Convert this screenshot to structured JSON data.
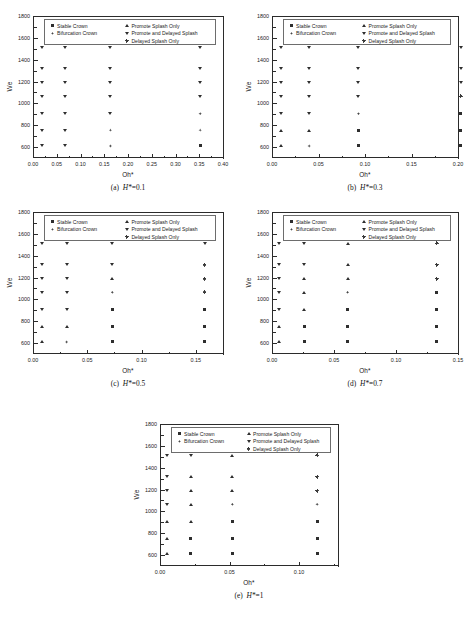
{
  "figure": {
    "axis_titles": {
      "x": "Oh*",
      "y": "We"
    },
    "legend_entries": [
      {
        "marker": "square",
        "label": "Stable Crown"
      },
      {
        "marker": "bifurcation",
        "label": "Bifurcation Crown"
      },
      {
        "marker": "tri-up",
        "label": "Promote Splash Only"
      },
      {
        "marker": "tri-down",
        "label": "Promote and Delayed Splash"
      },
      {
        "marker": "plus",
        "label": "Delayed Splash Only"
      }
    ],
    "y_ticks": [
      "600",
      "800",
      "1000",
      "1200",
      "1400",
      "1600",
      "1800"
    ]
  },
  "chart_data": [
    {
      "id": "a",
      "type": "scatter",
      "title": "(a)  H*=0.1",
      "caption_prefix": "(a)",
      "caption_symbol": "H*",
      "caption_value": "=0.1",
      "xlabel": "Oh*",
      "ylabel": "We",
      "xlim": [
        0.0,
        0.4
      ],
      "ylim": [
        500,
        1800
      ],
      "x_ticks": [
        "0.00",
        "0.05",
        "0.10",
        "0.15",
        "0.20",
        "0.25",
        "0.30",
        "0.35",
        "0.40"
      ],
      "y_ticks": [
        "600",
        "800",
        "1000",
        "1200",
        "1400",
        "1600",
        "1800"
      ],
      "x_values": [
        0.018,
        0.068,
        0.163,
        0.352
      ],
      "y_values": [
        610,
        755,
        905,
        1065,
        1190,
        1315,
        1515
      ],
      "points": [
        {
          "x": 0.018,
          "y": 1515,
          "marker": "tri-down"
        },
        {
          "x": 0.068,
          "y": 1515,
          "marker": "tri-down"
        },
        {
          "x": 0.163,
          "y": 1515,
          "marker": "tri-down"
        },
        {
          "x": 0.352,
          "y": 1515,
          "marker": "tri-down"
        },
        {
          "x": 0.018,
          "y": 1315,
          "marker": "tri-down"
        },
        {
          "x": 0.068,
          "y": 1315,
          "marker": "tri-down"
        },
        {
          "x": 0.163,
          "y": 1315,
          "marker": "tri-down"
        },
        {
          "x": 0.352,
          "y": 1315,
          "marker": "tri-down"
        },
        {
          "x": 0.018,
          "y": 1190,
          "marker": "tri-down"
        },
        {
          "x": 0.068,
          "y": 1190,
          "marker": "tri-down"
        },
        {
          "x": 0.163,
          "y": 1190,
          "marker": "tri-down"
        },
        {
          "x": 0.352,
          "y": 1190,
          "marker": "tri-down"
        },
        {
          "x": 0.018,
          "y": 1065,
          "marker": "tri-down"
        },
        {
          "x": 0.068,
          "y": 1065,
          "marker": "tri-down"
        },
        {
          "x": 0.163,
          "y": 1065,
          "marker": "tri-down"
        },
        {
          "x": 0.352,
          "y": 1065,
          "marker": "tri-down"
        },
        {
          "x": 0.018,
          "y": 905,
          "marker": "tri-down"
        },
        {
          "x": 0.068,
          "y": 905,
          "marker": "tri-down"
        },
        {
          "x": 0.163,
          "y": 905,
          "marker": "tri-down"
        },
        {
          "x": 0.352,
          "y": 905,
          "marker": "bifurcation"
        },
        {
          "x": 0.018,
          "y": 755,
          "marker": "tri-down"
        },
        {
          "x": 0.068,
          "y": 755,
          "marker": "tri-down"
        },
        {
          "x": 0.163,
          "y": 755,
          "marker": "bifurcation"
        },
        {
          "x": 0.352,
          "y": 755,
          "marker": "bifurcation"
        },
        {
          "x": 0.018,
          "y": 610,
          "marker": "tri-down"
        },
        {
          "x": 0.068,
          "y": 610,
          "marker": "tri-down"
        },
        {
          "x": 0.163,
          "y": 610,
          "marker": "bifurcation"
        },
        {
          "x": 0.352,
          "y": 610,
          "marker": "square"
        }
      ]
    },
    {
      "id": "b",
      "type": "scatter",
      "title": "(b)  H*=0.3",
      "caption_prefix": "(b)",
      "caption_symbol": "H*",
      "caption_value": "=0.3",
      "xlabel": "Oh*",
      "ylabel": "We",
      "xlim": [
        0.0,
        0.2
      ],
      "ylim": [
        500,
        1800
      ],
      "x_ticks": [
        "0.00",
        "0.05",
        "0.10",
        "0.15",
        "0.20"
      ],
      "y_ticks": [
        "600",
        "800",
        "1000",
        "1200",
        "1400",
        "1600",
        "1800"
      ],
      "x_values": [
        0.01,
        0.04,
        0.093,
        0.203
      ],
      "y_values": [
        610,
        755,
        905,
        1065,
        1190,
        1315,
        1515
      ],
      "points": [
        {
          "x": 0.01,
          "y": 1515,
          "marker": "tri-down"
        },
        {
          "x": 0.04,
          "y": 1515,
          "marker": "tri-down"
        },
        {
          "x": 0.093,
          "y": 1515,
          "marker": "tri-down"
        },
        {
          "x": 0.203,
          "y": 1515,
          "marker": "tri-down"
        },
        {
          "x": 0.01,
          "y": 1315,
          "marker": "tri-down"
        },
        {
          "x": 0.04,
          "y": 1315,
          "marker": "tri-down"
        },
        {
          "x": 0.093,
          "y": 1315,
          "marker": "tri-down"
        },
        {
          "x": 0.203,
          "y": 1315,
          "marker": "tri-down"
        },
        {
          "x": 0.01,
          "y": 1190,
          "marker": "tri-down"
        },
        {
          "x": 0.04,
          "y": 1190,
          "marker": "tri-down"
        },
        {
          "x": 0.093,
          "y": 1190,
          "marker": "tri-down"
        },
        {
          "x": 0.203,
          "y": 1190,
          "marker": "tri-down"
        },
        {
          "x": 0.01,
          "y": 1065,
          "marker": "tri-down"
        },
        {
          "x": 0.04,
          "y": 1065,
          "marker": "tri-down"
        },
        {
          "x": 0.093,
          "y": 1065,
          "marker": "tri-down"
        },
        {
          "x": 0.203,
          "y": 1065,
          "marker": "plus"
        },
        {
          "x": 0.01,
          "y": 905,
          "marker": "tri-down"
        },
        {
          "x": 0.04,
          "y": 905,
          "marker": "tri-down"
        },
        {
          "x": 0.093,
          "y": 905,
          "marker": "bifurcation"
        },
        {
          "x": 0.203,
          "y": 905,
          "marker": "square"
        },
        {
          "x": 0.01,
          "y": 755,
          "marker": "tri-up"
        },
        {
          "x": 0.04,
          "y": 755,
          "marker": "tri-up"
        },
        {
          "x": 0.093,
          "y": 755,
          "marker": "square"
        },
        {
          "x": 0.203,
          "y": 755,
          "marker": "square"
        },
        {
          "x": 0.01,
          "y": 610,
          "marker": "tri-up"
        },
        {
          "x": 0.04,
          "y": 610,
          "marker": "bifurcation"
        },
        {
          "x": 0.093,
          "y": 610,
          "marker": "square"
        },
        {
          "x": 0.203,
          "y": 610,
          "marker": "square"
        }
      ]
    },
    {
      "id": "c",
      "type": "scatter",
      "title": "(c)  H*=0.5",
      "caption_prefix": "(c)",
      "caption_symbol": "H*",
      "caption_value": "=0.5",
      "xlabel": "Oh*",
      "ylabel": "We",
      "xlim": [
        0.0,
        0.175
      ],
      "ylim": [
        500,
        1800
      ],
      "x_ticks": [
        "0.00",
        "0.05",
        "0.10",
        "0.15"
      ],
      "y_ticks": [
        "600",
        "800",
        "1000",
        "1200",
        "1400",
        "1600",
        "1800"
      ],
      "x_values": [
        0.008,
        0.031,
        0.073,
        0.158
      ],
      "y_values": [
        610,
        755,
        905,
        1065,
        1190,
        1315,
        1515
      ],
      "points": [
        {
          "x": 0.008,
          "y": 1515,
          "marker": "tri-down"
        },
        {
          "x": 0.031,
          "y": 1515,
          "marker": "tri-down"
        },
        {
          "x": 0.073,
          "y": 1515,
          "marker": "tri-down"
        },
        {
          "x": 0.158,
          "y": 1515,
          "marker": "tri-down"
        },
        {
          "x": 0.008,
          "y": 1315,
          "marker": "tri-down"
        },
        {
          "x": 0.031,
          "y": 1315,
          "marker": "tri-down"
        },
        {
          "x": 0.073,
          "y": 1315,
          "marker": "tri-down"
        },
        {
          "x": 0.158,
          "y": 1315,
          "marker": "plus"
        },
        {
          "x": 0.008,
          "y": 1190,
          "marker": "tri-down"
        },
        {
          "x": 0.031,
          "y": 1190,
          "marker": "tri-down"
        },
        {
          "x": 0.073,
          "y": 1190,
          "marker": "tri-up"
        },
        {
          "x": 0.158,
          "y": 1190,
          "marker": "plus"
        },
        {
          "x": 0.008,
          "y": 1065,
          "marker": "tri-down"
        },
        {
          "x": 0.031,
          "y": 1065,
          "marker": "tri-down"
        },
        {
          "x": 0.073,
          "y": 1065,
          "marker": "bifurcation"
        },
        {
          "x": 0.158,
          "y": 1065,
          "marker": "plus"
        },
        {
          "x": 0.008,
          "y": 905,
          "marker": "tri-down"
        },
        {
          "x": 0.031,
          "y": 905,
          "marker": "tri-down"
        },
        {
          "x": 0.073,
          "y": 905,
          "marker": "square"
        },
        {
          "x": 0.158,
          "y": 905,
          "marker": "square"
        },
        {
          "x": 0.008,
          "y": 755,
          "marker": "tri-up"
        },
        {
          "x": 0.031,
          "y": 755,
          "marker": "tri-up"
        },
        {
          "x": 0.073,
          "y": 755,
          "marker": "square"
        },
        {
          "x": 0.158,
          "y": 755,
          "marker": "square"
        },
        {
          "x": 0.008,
          "y": 610,
          "marker": "tri-up"
        },
        {
          "x": 0.031,
          "y": 610,
          "marker": "bifurcation"
        },
        {
          "x": 0.073,
          "y": 610,
          "marker": "square"
        },
        {
          "x": 0.158,
          "y": 610,
          "marker": "square"
        }
      ]
    },
    {
      "id": "d",
      "type": "scatter",
      "title": "(d)  H*=0.7",
      "caption_prefix": "(d)",
      "caption_symbol": "H*",
      "caption_value": "=0.7",
      "xlabel": "Oh*",
      "ylabel": "We",
      "xlim": [
        0.0,
        0.15
      ],
      "ylim": [
        500,
        1800
      ],
      "x_ticks": [
        "0.00",
        "0.05",
        "0.10",
        "0.15"
      ],
      "y_ticks": [
        "600",
        "800",
        "1000",
        "1200",
        "1400",
        "1600",
        "1800"
      ],
      "x_values": [
        0.006,
        0.026,
        0.061,
        0.133
      ],
      "y_values": [
        610,
        755,
        905,
        1065,
        1190,
        1315,
        1515
      ],
      "points": [
        {
          "x": 0.006,
          "y": 1515,
          "marker": "tri-down"
        },
        {
          "x": 0.026,
          "y": 1515,
          "marker": "tri-down"
        },
        {
          "x": 0.061,
          "y": 1515,
          "marker": "tri-up"
        },
        {
          "x": 0.133,
          "y": 1515,
          "marker": "plus"
        },
        {
          "x": 0.006,
          "y": 1315,
          "marker": "tri-down"
        },
        {
          "x": 0.026,
          "y": 1315,
          "marker": "tri-down"
        },
        {
          "x": 0.061,
          "y": 1315,
          "marker": "tri-up"
        },
        {
          "x": 0.133,
          "y": 1315,
          "marker": "plus"
        },
        {
          "x": 0.006,
          "y": 1190,
          "marker": "tri-down"
        },
        {
          "x": 0.026,
          "y": 1190,
          "marker": "tri-up"
        },
        {
          "x": 0.061,
          "y": 1190,
          "marker": "tri-up"
        },
        {
          "x": 0.133,
          "y": 1190,
          "marker": "plus"
        },
        {
          "x": 0.006,
          "y": 1065,
          "marker": "tri-down"
        },
        {
          "x": 0.026,
          "y": 1065,
          "marker": "tri-up"
        },
        {
          "x": 0.061,
          "y": 1065,
          "marker": "bifurcation"
        },
        {
          "x": 0.133,
          "y": 1065,
          "marker": "square"
        },
        {
          "x": 0.006,
          "y": 905,
          "marker": "tri-down"
        },
        {
          "x": 0.026,
          "y": 905,
          "marker": "tri-up"
        },
        {
          "x": 0.061,
          "y": 905,
          "marker": "square"
        },
        {
          "x": 0.133,
          "y": 905,
          "marker": "square"
        },
        {
          "x": 0.006,
          "y": 755,
          "marker": "tri-up"
        },
        {
          "x": 0.026,
          "y": 755,
          "marker": "square"
        },
        {
          "x": 0.061,
          "y": 755,
          "marker": "square"
        },
        {
          "x": 0.133,
          "y": 755,
          "marker": "square"
        },
        {
          "x": 0.006,
          "y": 610,
          "marker": "tri-up"
        },
        {
          "x": 0.026,
          "y": 610,
          "marker": "square"
        },
        {
          "x": 0.061,
          "y": 610,
          "marker": "square"
        },
        {
          "x": 0.133,
          "y": 610,
          "marker": "square"
        }
      ]
    },
    {
      "id": "e",
      "type": "scatter",
      "title": "(e)  H*=1",
      "caption_prefix": "(e)",
      "caption_symbol": "H*",
      "caption_value": "=1",
      "xlabel": "Oh*",
      "ylabel": "We",
      "xlim": [
        0.0,
        0.128
      ],
      "ylim": [
        500,
        1800
      ],
      "x_ticks": [
        "0.00",
        "0.05",
        "0.10"
      ],
      "y_ticks": [
        "600",
        "800",
        "1000",
        "1200",
        "1400",
        "1600",
        "1800"
      ],
      "x_values": [
        0.005,
        0.022,
        0.052,
        0.113
      ],
      "y_values": [
        610,
        755,
        905,
        1065,
        1190,
        1315,
        1515
      ],
      "points": [
        {
          "x": 0.005,
          "y": 1515,
          "marker": "tri-down"
        },
        {
          "x": 0.022,
          "y": 1515,
          "marker": "tri-down"
        },
        {
          "x": 0.052,
          "y": 1515,
          "marker": "tri-up"
        },
        {
          "x": 0.113,
          "y": 1515,
          "marker": "plus"
        },
        {
          "x": 0.005,
          "y": 1315,
          "marker": "tri-down"
        },
        {
          "x": 0.022,
          "y": 1315,
          "marker": "tri-up"
        },
        {
          "x": 0.052,
          "y": 1315,
          "marker": "tri-up"
        },
        {
          "x": 0.113,
          "y": 1315,
          "marker": "plus"
        },
        {
          "x": 0.005,
          "y": 1190,
          "marker": "tri-down"
        },
        {
          "x": 0.022,
          "y": 1190,
          "marker": "tri-up"
        },
        {
          "x": 0.052,
          "y": 1190,
          "marker": "tri-up"
        },
        {
          "x": 0.113,
          "y": 1190,
          "marker": "plus"
        },
        {
          "x": 0.005,
          "y": 1065,
          "marker": "tri-down"
        },
        {
          "x": 0.022,
          "y": 1065,
          "marker": "tri-up"
        },
        {
          "x": 0.052,
          "y": 1065,
          "marker": "bifurcation"
        },
        {
          "x": 0.113,
          "y": 1065,
          "marker": "bifurcation"
        },
        {
          "x": 0.005,
          "y": 905,
          "marker": "tri-up"
        },
        {
          "x": 0.022,
          "y": 905,
          "marker": "tri-up"
        },
        {
          "x": 0.052,
          "y": 905,
          "marker": "square"
        },
        {
          "x": 0.113,
          "y": 905,
          "marker": "square"
        },
        {
          "x": 0.005,
          "y": 755,
          "marker": "tri-up"
        },
        {
          "x": 0.022,
          "y": 755,
          "marker": "square"
        },
        {
          "x": 0.052,
          "y": 755,
          "marker": "square"
        },
        {
          "x": 0.113,
          "y": 755,
          "marker": "square"
        },
        {
          "x": 0.005,
          "y": 610,
          "marker": "tri-up"
        },
        {
          "x": 0.022,
          "y": 610,
          "marker": "square"
        },
        {
          "x": 0.052,
          "y": 610,
          "marker": "square"
        },
        {
          "x": 0.113,
          "y": 610,
          "marker": "square"
        }
      ]
    }
  ]
}
